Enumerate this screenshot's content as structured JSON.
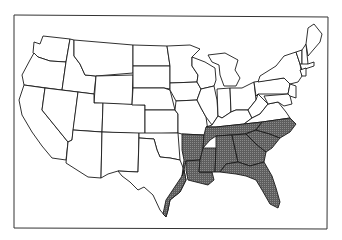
{
  "map": {
    "type": "choropleth",
    "region": "Contiguous United States",
    "fill_color": "#6e6e6e",
    "outline_color": "#222222",
    "background": "#ffffff",
    "highlighted_states": [
      "Texas (east/gulf coast)",
      "Arkansas",
      "Louisiana",
      "Mississippi",
      "Alabama",
      "Tennessee",
      "Georgia",
      "Florida",
      "South Carolina",
      "North Carolina"
    ]
  }
}
